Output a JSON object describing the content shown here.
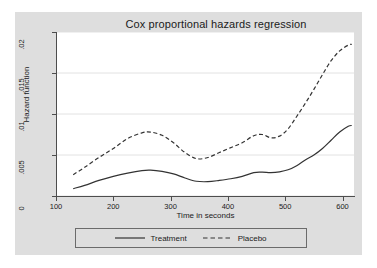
{
  "chart_data": {
    "type": "line",
    "title": "Cox proportional hazards regression",
    "xlabel": "Time in seconds",
    "ylabel": "Hazard function",
    "xlim": [
      100,
      620
    ],
    "ylim": [
      0,
      0.02
    ],
    "xticks": [
      100,
      200,
      300,
      400,
      500,
      600
    ],
    "xtick_labels": [
      "100",
      "200",
      "300",
      "400",
      "500",
      "600"
    ],
    "yticks": [
      0,
      0.005,
      0.01,
      0.015,
      0.02
    ],
    "ytick_labels": [
      "0",
      ".005",
      ".01",
      ".015",
      ".02"
    ],
    "grid": "horizontal",
    "legend_position": "bottom",
    "series": [
      {
        "name": "Treatment",
        "style": "solid",
        "color": "#333333",
        "x": [
          130,
          150,
          175,
          200,
          225,
          250,
          265,
          285,
          305,
          325,
          345,
          365,
          385,
          405,
          425,
          445,
          460,
          475,
          490,
          505,
          520,
          535,
          550,
          565,
          580,
          595,
          610,
          616
        ],
        "y": [
          0.0009,
          0.0013,
          0.0019,
          0.0024,
          0.0028,
          0.0031,
          0.00315,
          0.003,
          0.0027,
          0.0022,
          0.0018,
          0.00175,
          0.0019,
          0.0021,
          0.0024,
          0.00285,
          0.0029,
          0.00285,
          0.00295,
          0.0032,
          0.0037,
          0.0044,
          0.005,
          0.0058,
          0.0068,
          0.0078,
          0.0085,
          0.0086
        ]
      },
      {
        "name": "Placebo",
        "style": "dashed",
        "color": "#333333",
        "x": [
          130,
          150,
          175,
          200,
          225,
          250,
          265,
          285,
          305,
          325,
          345,
          365,
          385,
          405,
          425,
          445,
          460,
          475,
          490,
          505,
          520,
          535,
          550,
          565,
          580,
          595,
          610,
          616
        ],
        "y": [
          0.0026,
          0.0035,
          0.0047,
          0.0058,
          0.007,
          0.0077,
          0.0078,
          0.0074,
          0.0065,
          0.0053,
          0.00455,
          0.0047,
          0.0053,
          0.0059,
          0.0065,
          0.00735,
          0.0075,
          0.0071,
          0.0073,
          0.0082,
          0.0097,
          0.0113,
          0.013,
          0.0148,
          0.0165,
          0.0177,
          0.0184,
          0.0185
        ]
      }
    ]
  },
  "legend": {
    "entries": [
      {
        "label": "Treatment",
        "style": "solid"
      },
      {
        "label": "Placebo",
        "style": "dashed"
      }
    ]
  }
}
